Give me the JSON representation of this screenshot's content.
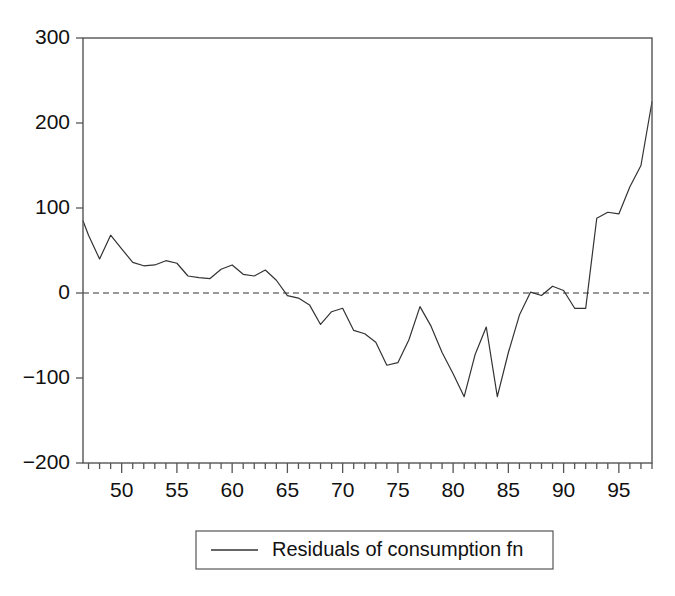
{
  "chart_data": {
    "type": "line",
    "title": "",
    "xlabel": "",
    "ylabel": "",
    "xlim": [
      46.5,
      98.0
    ],
    "ylim": [
      -200,
      300
    ],
    "yticks": [
      -200,
      -100,
      0,
      100,
      200,
      300
    ],
    "ytick_labels": [
      "−200",
      "−100",
      "0",
      "100",
      "200",
      "300"
    ],
    "xticks": [
      50,
      55,
      60,
      65,
      70,
      75,
      80,
      85,
      90,
      95
    ],
    "xtick_labels": [
      "50",
      "55",
      "60",
      "65",
      "70",
      "75",
      "80",
      "85",
      "90",
      "95"
    ],
    "minor_xtick_step": 1,
    "grid": false,
    "zero_reference_line": {
      "value": 0,
      "style": "dashed",
      "color": "#333333"
    },
    "frame": {
      "top": true,
      "right": true,
      "bottom": true,
      "left": true,
      "color": "#555555"
    },
    "legend": {
      "position": "below-axes",
      "boxed": true,
      "entries": [
        {
          "label": "Residuals of consumption fn",
          "marker": "line",
          "color": "#333333"
        }
      ]
    },
    "series": [
      {
        "name": "Residuals of consumption fn",
        "color": "#333333",
        "line_width": 1.2,
        "x": [
          46.5,
          47,
          48,
          49,
          50,
          51,
          52,
          53,
          54,
          55,
          56,
          57,
          58,
          59,
          60,
          61,
          62,
          63,
          64,
          65,
          66,
          67,
          68,
          69,
          70,
          71,
          72,
          73,
          74,
          75,
          76,
          77,
          78,
          79,
          80,
          81,
          82,
          83,
          84,
          85,
          86,
          87,
          88,
          89,
          90,
          91,
          92,
          93,
          94,
          95,
          96,
          97,
          98
        ],
        "y": [
          85,
          68,
          40,
          68,
          52,
          36,
          32,
          33,
          38,
          35,
          20,
          18,
          17,
          28,
          33,
          22,
          20,
          27,
          15,
          -3,
          -6,
          -14,
          -37,
          -22,
          -18,
          -44,
          -48,
          -58,
          -85,
          -82,
          -55,
          -16,
          -39,
          -70,
          -95,
          -122,
          -72,
          -40,
          -122,
          -70,
          -26,
          1,
          -3,
          8,
          3,
          -18,
          -18,
          88,
          95,
          93,
          125,
          150,
          225
        ]
      }
    ]
  }
}
